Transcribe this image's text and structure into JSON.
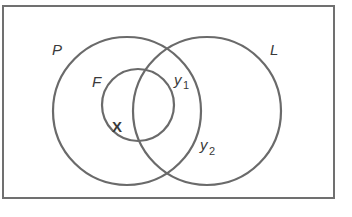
{
  "diagram": {
    "type": "venn",
    "frame": {
      "x": 3,
      "y": 6,
      "width": 331,
      "height": 192,
      "stroke": "#6f6f6f"
    },
    "stroke_color": "#6a6a6a",
    "sets": [
      {
        "id": "P",
        "label": "P",
        "cx": 127,
        "cy": 111,
        "r": 74,
        "label_x": 52,
        "label_y": 55
      },
      {
        "id": "L",
        "label": "L",
        "cx": 207,
        "cy": 111,
        "r": 74,
        "label_x": 270,
        "label_y": 55
      },
      {
        "id": "F",
        "label": "F",
        "cx": 138,
        "cy": 105,
        "r": 36,
        "label_x": 92,
        "label_y": 87
      }
    ],
    "points": [
      {
        "label": "X",
        "x": 113,
        "y": 132,
        "bold": true
      },
      {
        "label": "y",
        "sub": "1",
        "x": 174,
        "y": 85
      },
      {
        "label": "y",
        "sub": "2",
        "x": 200,
        "y": 150
      }
    ]
  }
}
